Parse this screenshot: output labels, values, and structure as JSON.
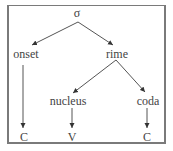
{
  "diagram": {
    "type": "syllable-structure-tree",
    "colors": {
      "line": "#555555",
      "text": "#444444",
      "border": "#7a7a7a"
    },
    "nodes": {
      "root": {
        "label": "σ"
      },
      "onset": {
        "label": "onset"
      },
      "rime": {
        "label": "rime"
      },
      "nucleus": {
        "label": "nucleus"
      },
      "coda": {
        "label": "coda"
      },
      "onset_leaf": {
        "label": "C"
      },
      "nucleus_leaf": {
        "label": "V"
      },
      "coda_leaf": {
        "label": "C"
      }
    },
    "edges": [
      {
        "from": "σ",
        "to": "onset"
      },
      {
        "from": "σ",
        "to": "rime"
      },
      {
        "from": "rime",
        "to": "nucleus"
      },
      {
        "from": "rime",
        "to": "coda"
      },
      {
        "from": "onset",
        "to": "C"
      },
      {
        "from": "nucleus",
        "to": "V"
      },
      {
        "from": "coda",
        "to": "C"
      }
    ]
  }
}
